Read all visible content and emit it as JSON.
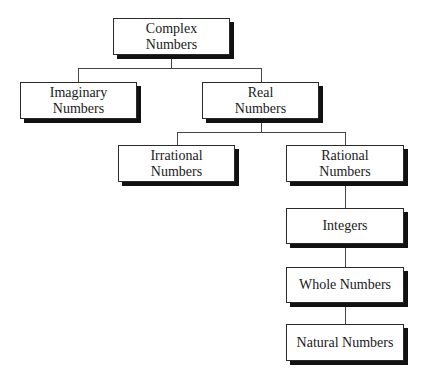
{
  "diagram": {
    "nodes": {
      "complex": {
        "line1": "Complex",
        "line2": "Numbers"
      },
      "imaginary": {
        "line1": "Imaginary",
        "line2": "Numbers"
      },
      "real": {
        "line1": "Real",
        "line2": "Numbers"
      },
      "irrational": {
        "line1": "Irrational",
        "line2": "Numbers"
      },
      "rational": {
        "line1": "Rational",
        "line2": "Numbers"
      },
      "integers": {
        "line1": "Integers"
      },
      "whole": {
        "line1": "Whole Numbers"
      },
      "natural": {
        "line1": "Natural Numbers"
      }
    },
    "edges": [
      [
        "complex",
        "imaginary"
      ],
      [
        "complex",
        "real"
      ],
      [
        "real",
        "irrational"
      ],
      [
        "real",
        "rational"
      ],
      [
        "rational",
        "integers"
      ],
      [
        "integers",
        "whole"
      ],
      [
        "whole",
        "natural"
      ]
    ]
  }
}
